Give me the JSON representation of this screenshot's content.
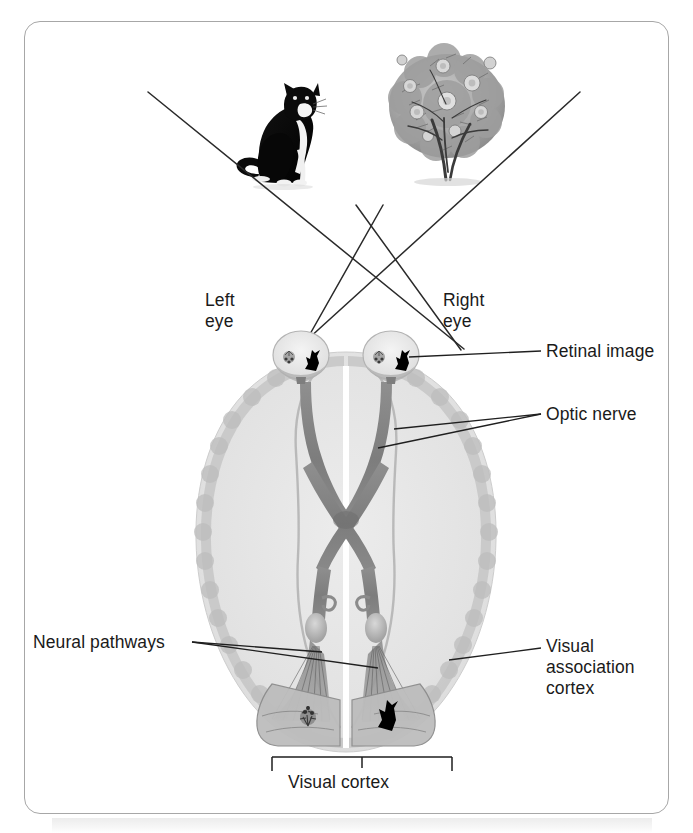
{
  "figure": {
    "frame_border_color": "#a7a7a7",
    "background_color": "#ffffff",
    "text_color": "#1a1a1a",
    "line_color": "#2a2a2a"
  },
  "labels": {
    "left_eye": "Left\neye",
    "right_eye": "Right\neye",
    "retinal_image": "Retinal image",
    "optic_nerve": "Optic nerve",
    "neural_pathways": "Neural pathways",
    "visual_association_cortex": "Visual\nassociation\ncortex",
    "visual_cortex": "Visual cortex"
  },
  "stimuli": [
    {
      "name": "cat",
      "description": "Black and white cat sitting, viewed in left visual field",
      "x": 290,
      "y": 140
    },
    {
      "name": "rose-bush",
      "description": "Flowering rose bush, viewed in right visual field",
      "x": 445,
      "y": 115
    }
  ],
  "retinal_images": [
    {
      "eye": "left",
      "contents": [
        "rose-bush-inverted",
        "cat-inverted"
      ]
    },
    {
      "eye": "right",
      "contents": [
        "rose-bush-inverted",
        "cat-inverted"
      ]
    }
  ],
  "cortex_images": [
    {
      "hemisphere": "left",
      "contents": "rose-bush"
    },
    {
      "hemisphere": "right",
      "contents": "cat"
    }
  ],
  "anatomy": {
    "brain_fill": "#e3e3e3",
    "cortex_band": "#c4c4c4",
    "tract_color": "#8b8b8b",
    "tract_dark": "#6f6f6f",
    "eye_fill": "#eeeeee",
    "chiasm": "optic chiasm where nerve fibers cross",
    "parts": [
      "left eye",
      "right eye",
      "optic nerve",
      "optic chiasm",
      "optic tract",
      "lateral geniculate nucleus",
      "optic radiations",
      "visual cortex",
      "visual association cortex"
    ]
  },
  "light_rays": {
    "count": 4,
    "description": "Two pairs of crossing light rays travel from the cat and the bush to each eye"
  },
  "bracket": {
    "label": "Visual cortex",
    "left_x": 272,
    "right_x": 452,
    "y": 757
  }
}
